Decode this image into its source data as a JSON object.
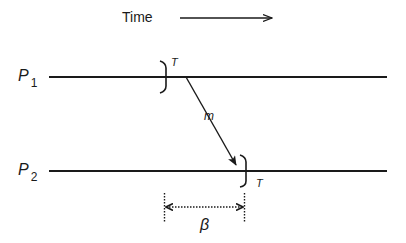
{
  "diagram": {
    "time_axis": {
      "label": "Time",
      "direction": "right"
    },
    "processes": [
      {
        "id": "P1",
        "name": "P",
        "subscript": "1",
        "event_label": "T"
      },
      {
        "id": "P2",
        "name": "P",
        "subscript": "2",
        "event_label": "T"
      }
    ],
    "message": {
      "label": "m",
      "from": "P1",
      "to": "P2"
    },
    "interval": {
      "label": "β",
      "style": "dotted",
      "arrows": "both"
    },
    "colors": {
      "ink": "#1a1a1a",
      "background": "#ffffff"
    }
  }
}
